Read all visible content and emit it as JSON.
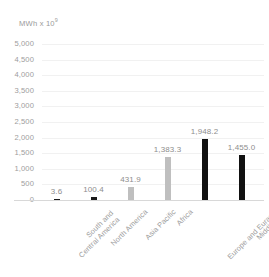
{
  "chart_data": {
    "type": "bar",
    "title": "",
    "subtitle": "",
    "xlabel": "",
    "ylabel": "MWh x 10⁹",
    "ylabel_base": "MWh x 10",
    "ylabel_exponent": "9",
    "categories": [
      "South and Central America",
      "North America",
      "Asia Pacific",
      "Africa",
      "Europe and Eurasia",
      "Middle East"
    ],
    "categories_wrapped": [
      [
        "South and",
        "Central America"
      ],
      [
        "North America"
      ],
      [
        "Asia Pacific"
      ],
      [
        "Africa"
      ],
      [
        "Europe and Eurasia"
      ],
      [
        "Middle East"
      ]
    ],
    "values": [
      3.6,
      100.4,
      431.9,
      1383.3,
      1948.2,
      1455.0
    ],
    "data_labels": [
      "3.6",
      "100.4",
      "431.9",
      "1,383.3",
      "1,948.2",
      "1,455.0"
    ],
    "bar_colors": [
      "#1a1a1a",
      "#1a1a1a",
      "#bfbfbf",
      "#bfbfbf",
      "#111111",
      "#111111"
    ],
    "ylim": [
      0,
      5000
    ],
    "ytick_step": 500,
    "ytick_labels": [
      "5,000",
      "4,500",
      "4,000",
      "3,500",
      "3,000",
      "2,500",
      "2,000",
      "1,500",
      "1,000",
      "500",
      "0"
    ],
    "ytick_values": [
      5000,
      4500,
      4000,
      3500,
      3000,
      2500,
      2000,
      1500,
      1000,
      500,
      0
    ],
    "grid": true,
    "grid_color": "#f1f1f1",
    "legend": false,
    "legend_position": "none",
    "axis_text_color": "#9d9d9d",
    "label_text_color": "#8e8e8e",
    "background": "#ffffff"
  }
}
